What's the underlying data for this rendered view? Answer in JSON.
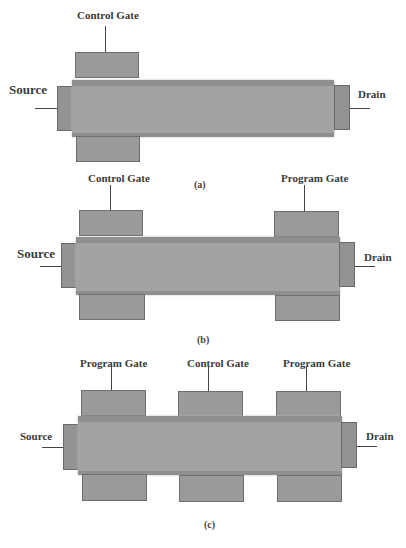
{
  "diagrams": {
    "a": {
      "caption": "(a)",
      "source_label": "Source",
      "drain_label": "Drain",
      "gates": [
        {
          "label": "Control Gate"
        }
      ]
    },
    "b": {
      "caption": "(b)",
      "source_label": "Source",
      "drain_label": "Drain",
      "gates": [
        {
          "label": "Control Gate"
        },
        {
          "label": "Program Gate"
        }
      ]
    },
    "c": {
      "caption": "(c)",
      "source_label": "Source",
      "drain_label": "Drain",
      "gates": [
        {
          "label": "Program Gate"
        },
        {
          "label": "Control Gate"
        },
        {
          "label": "Program Gate"
        }
      ]
    }
  },
  "colors": {
    "device_fill": "#9a9a9a",
    "device_border": "#6e6e6e",
    "text": "#3a3a3a"
  }
}
